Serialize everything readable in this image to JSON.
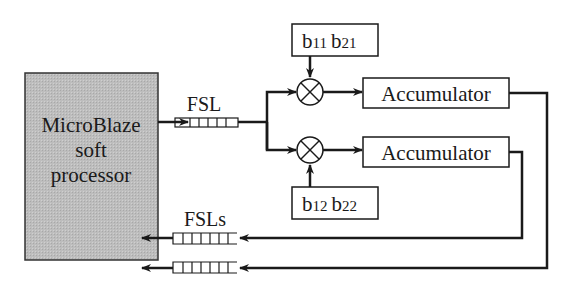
{
  "diagram": {
    "processor": {
      "line1": "MicroBlaze",
      "line2": "soft",
      "line3": "processor",
      "fill": "#bdbdbd"
    },
    "input_link_label": "FSL",
    "output_links_label": "FSLs",
    "coeff_top": {
      "b1": "b",
      "s1": "11",
      "b2": "b",
      "s2": "21"
    },
    "coeff_bottom": {
      "b1": "b",
      "s1": "12",
      "b2": "b",
      "s2": "22"
    },
    "accumulator_top": "Accumulator",
    "accumulator_bottom": "Accumulator",
    "line_color": "#1a1a1a"
  }
}
